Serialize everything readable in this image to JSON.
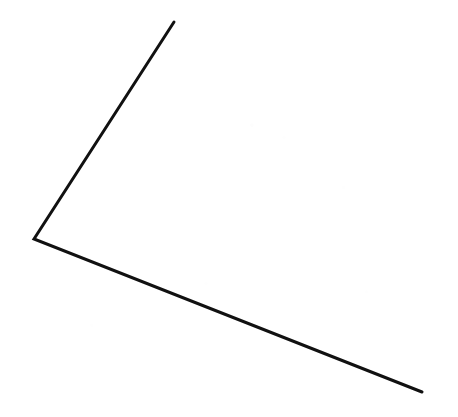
{
  "image": {
    "kind": "line-drawing",
    "subject": "open-angle",
    "description": "A single black polyline forming an open angle, vertex at left, one ray rising to the upper right and one ray descending to the lower right",
    "width": 458,
    "height": 417,
    "background_color": "#ffffff",
    "ink_color": "#111111",
    "stroke_width": 3,
    "stroke_linecap": "round",
    "stroke_linejoin": "miter"
  },
  "geometry": {
    "vertex": {
      "name": "angle-vertex",
      "x": 34,
      "y": 239
    },
    "rays": [
      {
        "name": "upper-ray",
        "from": {
          "x": 34,
          "y": 239
        },
        "to": {
          "x": 174,
          "y": 22
        },
        "length_px": 258,
        "direction_degrees": 57.2,
        "description": "ray going up and to the right from the vertex"
      },
      {
        "name": "lower-ray",
        "from": {
          "x": 34,
          "y": 239
        },
        "to": {
          "x": 422,
          "y": 392
        },
        "length_px": 417,
        "direction_degrees": -21.5,
        "description": "ray going down and to the right from the vertex"
      }
    ],
    "interior_angle_degrees": 101.3,
    "opening_direction": "right",
    "path_d": "M 174 22 L 34 239 L 422 392"
  },
  "labels": {
    "title": "",
    "caption": "",
    "annotations": []
  }
}
